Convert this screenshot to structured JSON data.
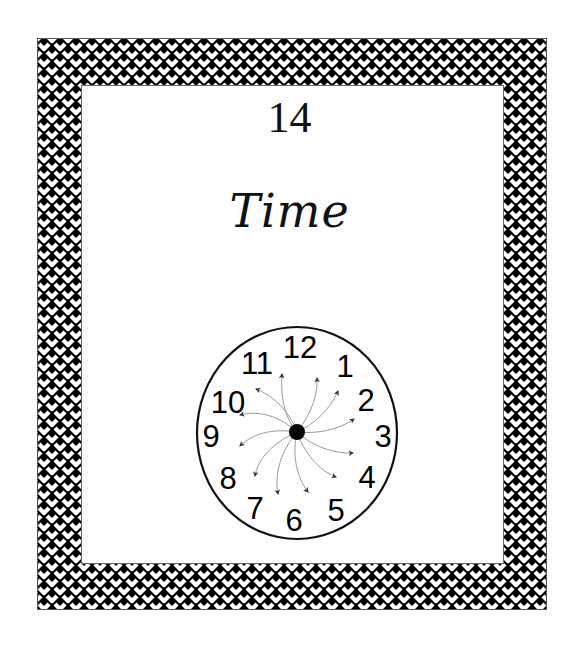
{
  "page": {
    "number": "14",
    "title": "Time"
  },
  "border": {
    "pattern": "basket-weave",
    "colors": {
      "dark": "#000000",
      "light": "#ffffff"
    }
  },
  "clock": {
    "numerals": [
      "12",
      "1",
      "2",
      "3",
      "4",
      "5",
      "6",
      "7",
      "8",
      "9",
      "10",
      "11"
    ],
    "arrow_count": 12,
    "center_dot": true,
    "arrow_color": "#444444",
    "line_color": "#999999"
  }
}
